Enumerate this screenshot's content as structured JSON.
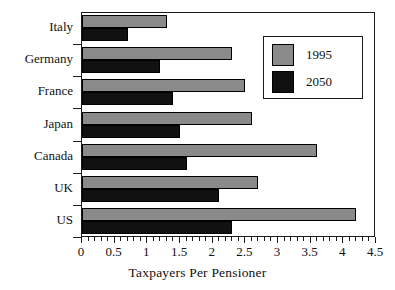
{
  "chart_data": {
    "type": "bar",
    "orientation": "horizontal",
    "title": "",
    "xlabel": "Taxpayers Per Pensioner",
    "ylabel": "",
    "xlim": [
      0,
      4.5
    ],
    "grid": false,
    "legend_position": "top-right",
    "categories": [
      "Italy",
      "Germany",
      "France",
      "Japan",
      "Canada",
      "UK",
      "US"
    ],
    "xticks": [
      0,
      0.5,
      1,
      1.5,
      2,
      2.5,
      3,
      3.5,
      4,
      4.5
    ],
    "xticklabels": [
      "0",
      "0.5",
      "1",
      "1.5",
      "2",
      "2.5",
      "3",
      "3.5",
      "4",
      "4.5"
    ],
    "series": [
      {
        "name": "1995",
        "color": "#8a8a8a",
        "values": [
          1.3,
          2.3,
          2.5,
          2.6,
          3.6,
          2.7,
          4.2
        ]
      },
      {
        "name": "2050",
        "color": "#111111",
        "values": [
          0.7,
          1.2,
          1.4,
          1.5,
          1.6,
          2.1,
          2.3
        ]
      }
    ]
  },
  "legend": {
    "entries": [
      {
        "label": "1995"
      },
      {
        "label": "2050"
      }
    ]
  }
}
